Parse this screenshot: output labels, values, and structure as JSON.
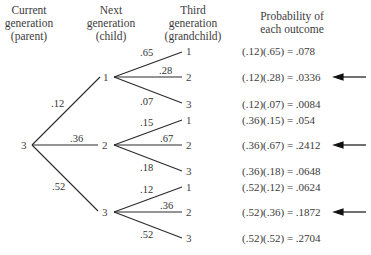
{
  "headers": {
    "current": [
      "Current",
      "generation",
      "(parent)"
    ],
    "next": [
      "Next",
      "generation",
      "(child)"
    ],
    "third": [
      "Third",
      "generation",
      "(grandchild)"
    ],
    "probability": [
      "Probability of",
      "each outcome"
    ]
  },
  "root": {
    "label": "3"
  },
  "children": [
    {
      "label": "1",
      "branch_prob": ".12"
    },
    {
      "label": "2",
      "branch_prob": ".36"
    },
    {
      "label": "3",
      "branch_prob": ".52"
    }
  ],
  "grandchildren": [
    {
      "parent": "1",
      "label": "1",
      "branch_prob": ".65"
    },
    {
      "parent": "1",
      "label": "2",
      "branch_prob": ".28"
    },
    {
      "parent": "1",
      "label": "3",
      "branch_prob": ".07"
    },
    {
      "parent": "2",
      "label": "1",
      "branch_prob": ".15"
    },
    {
      "parent": "2",
      "label": "2",
      "branch_prob": ".67"
    },
    {
      "parent": "2",
      "label": "3",
      "branch_prob": ".18"
    },
    {
      "parent": "3",
      "label": "1",
      "branch_prob": ".12"
    },
    {
      "parent": "3",
      "label": "2",
      "branch_prob": ".36"
    },
    {
      "parent": "3",
      "label": "3",
      "branch_prob": ".52"
    }
  ],
  "outcomes": [
    {
      "expr": "(.12)(.65) = .078",
      "highlighted": false
    },
    {
      "expr": "(.12)(.28) = .0336",
      "highlighted": true
    },
    {
      "expr": "(.12)(.07) = .0084",
      "highlighted": false
    },
    {
      "expr": "(.36)(.15) = .054",
      "highlighted": false
    },
    {
      "expr": "(.36)(.67) = .2412",
      "highlighted": true
    },
    {
      "expr": "(.36)(.18) = .0648",
      "highlighted": false
    },
    {
      "expr": "(.52)(.12) = .0624",
      "highlighted": false
    },
    {
      "expr": "(.52)(.36) = .1872",
      "highlighted": true
    },
    {
      "expr": "(.52)(.52) = .2704",
      "highlighted": false
    }
  ],
  "colors": {
    "line": "#2a2a2a",
    "text": "#3a3a3a",
    "arrow": "#111111"
  }
}
